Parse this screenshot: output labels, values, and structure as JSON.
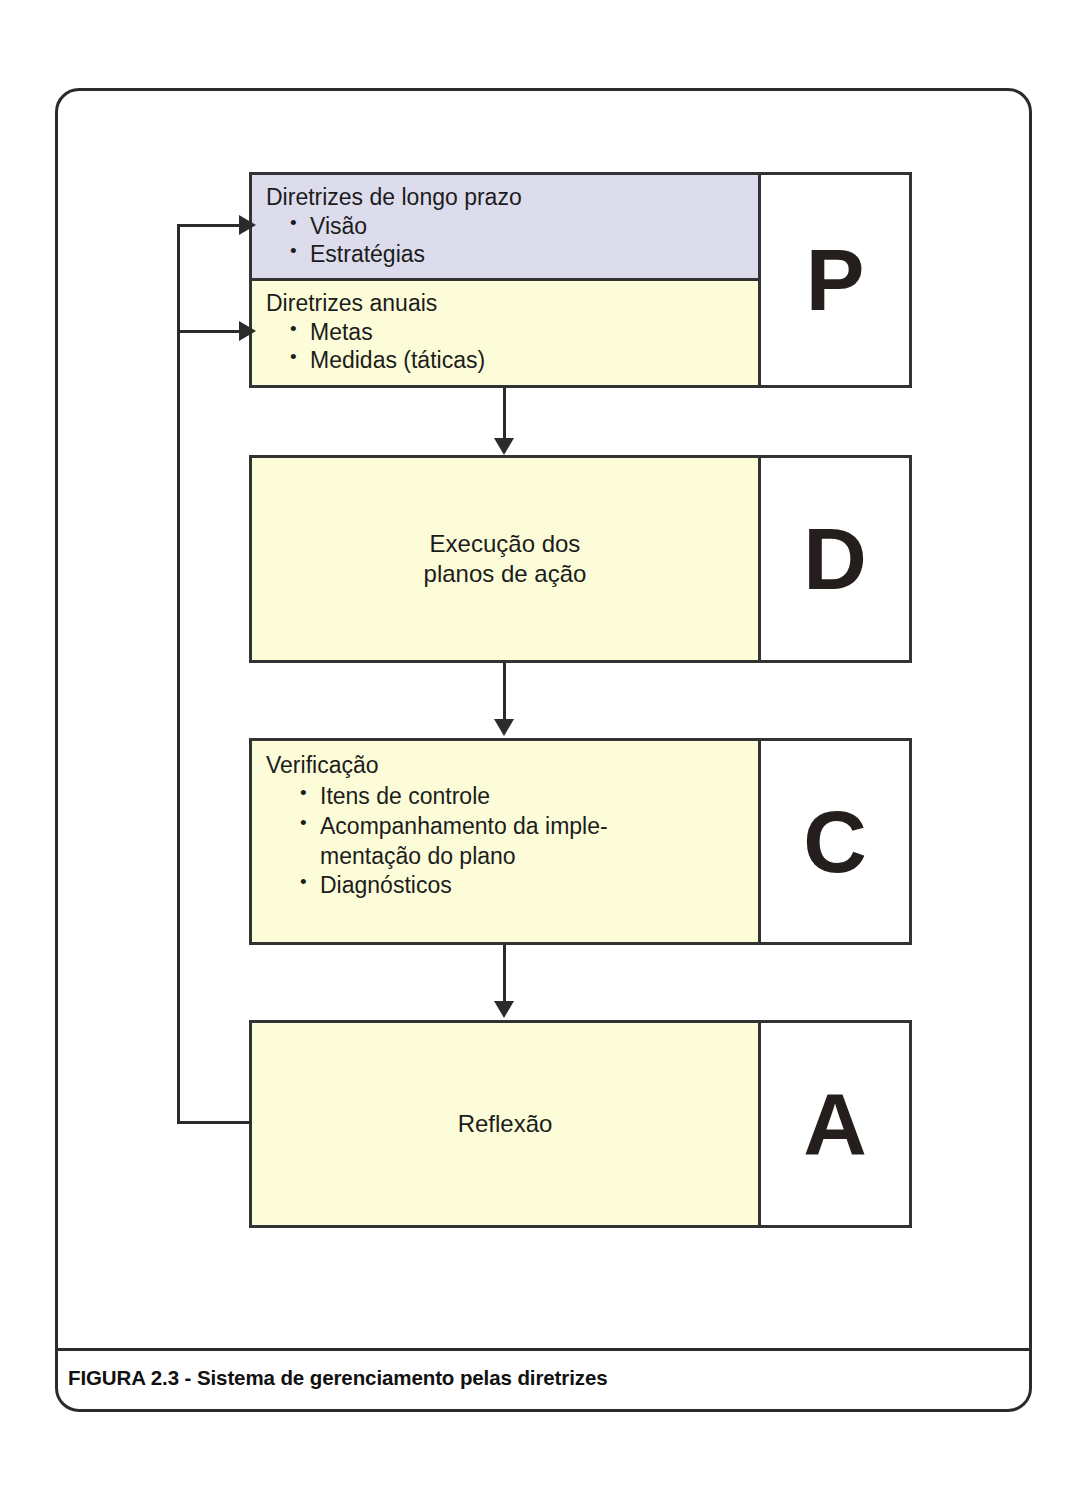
{
  "figure": {
    "caption": "FIGURA 2.3 - Sistema de gerenciamento pelas diretrizes",
    "colors": {
      "long_term_fill": "#dcdcec",
      "annual_fill": "#fcfcd8",
      "body_fill": "#fcfcd8",
      "letter_cell_fill": "#ffffff",
      "line": "#2b2b2b",
      "text": "#1c1c1c"
    }
  },
  "blocks": [
    {
      "letter": "P",
      "kind": "split",
      "rows": [
        {
          "id": "long-term",
          "heading": "Diretrizes de longo prazo",
          "fill": "#dcdcec",
          "bullets": [
            "Visão",
            "Estratégias"
          ]
        },
        {
          "id": "annual",
          "heading": "Diretrizes anuais",
          "fill": "#fcfcd8",
          "bullets": [
            "Metas",
            "Medidas (táticas)"
          ]
        }
      ]
    },
    {
      "letter": "D",
      "kind": "centered",
      "text_line1": "Execução dos",
      "text_line2": "planos de ação"
    },
    {
      "letter": "C",
      "kind": "listed",
      "heading": "Verificação",
      "bullets": [
        "Itens de controle",
        "Acompanhamento da imple-",
        "Diagnósticos"
      ],
      "bullet2_continuation": "mentação do plano"
    },
    {
      "letter": "A",
      "kind": "centered",
      "text_line1": "Reflexão",
      "text_line2": ""
    }
  ],
  "connectors": {
    "p_to_d": "arrow-down",
    "d_to_c": "arrow-down",
    "c_to_a": "arrow-down",
    "a_to_long_term": "feedback-arrow-right",
    "a_to_annual": "feedback-arrow-right"
  }
}
